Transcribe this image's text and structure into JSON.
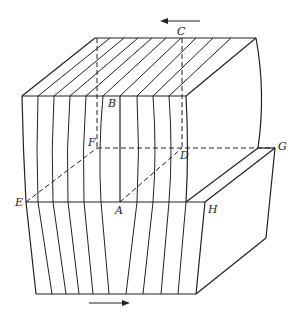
{
  "figure": {
    "labels": {
      "A": "A",
      "B": "B",
      "C": "C",
      "D": "D",
      "E": "E",
      "F": "F",
      "G": "G",
      "H": "H"
    },
    "arrows": {
      "top": {
        "direction": "left"
      },
      "bottom": {
        "direction": "right"
      }
    },
    "colors": {
      "line": "#222222",
      "background": "#ffffff"
    }
  }
}
